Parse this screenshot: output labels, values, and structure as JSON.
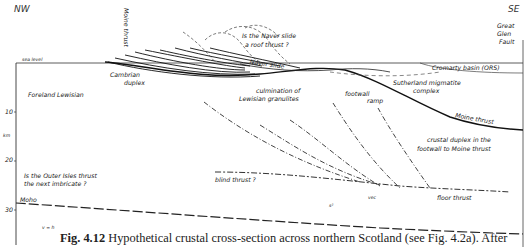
{
  "figure": {
    "directions": {
      "left": "NW",
      "right": "SE"
    },
    "depth_axis": {
      "unit": "km",
      "ticks": [
        "10",
        "20",
        "30"
      ]
    },
    "labels": {
      "sea_level": "sea level",
      "moine_thrust_top": "Moine thrust",
      "naver_question_line1": "Is the Naver slide",
      "naver_question_line2": "a roof thrust ?",
      "naver_slide": "Naver slide",
      "great_glen_line1": "Great",
      "great_glen_line2": "Glen",
      "great_glen_line3": "Fault",
      "cromarty": "Cromarty basin   (ORS)",
      "cambrian_line1": "Cambrian",
      "cambrian_line2": "duplex",
      "sutherland_line1": "Sutherland migmatite",
      "sutherland_line2": "complex",
      "foreland": "Foreland  Lewisian",
      "culmination_line1": "culmination of",
      "culmination_line2": "Lewisian granulites",
      "footwall_ramp_line1": "footwall",
      "footwall_ramp_line2": "ramp",
      "moine_thrust_lower": "Moine   thrust",
      "crustal_duplex_line1": "crustal duplex in the",
      "crustal_duplex_line2": "footwall to Moine thrust",
      "outer_isles_line1": "Is the Outer Isles thrust",
      "outer_isles_line2": "the next imbricate ?",
      "blind_thrust": "blind thrust ?",
      "moho": "Moho",
      "s_label": "s²",
      "vec": "vec",
      "floor_thrust": "floor thrust",
      "scale_ratio": "v = h"
    }
  },
  "caption": {
    "number": "Fig. 4.12",
    "text": "Hypothetical crustal cross-section across northern Scotland (see Fig. 4.2a). After"
  }
}
